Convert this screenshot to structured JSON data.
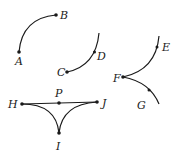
{
  "diagram": {
    "points": {
      "A": {
        "label": "A",
        "x": 19,
        "y": 52
      },
      "B": {
        "label": "B",
        "x": 56,
        "y": 15
      },
      "C": {
        "label": "C",
        "x": 67,
        "y": 72
      },
      "D": {
        "label": "D",
        "x": 94,
        "y": 51
      },
      "E": {
        "label": "E",
        "x": 157,
        "y": 46
      },
      "F": {
        "label": "F",
        "x": 123,
        "y": 77
      },
      "G": {
        "label": "G",
        "x": 149,
        "y": 89
      },
      "H": {
        "label": "H",
        "x": 22,
        "y": 104
      },
      "P": {
        "label": "P",
        "x": 59,
        "y": 103
      },
      "J": {
        "label": "J",
        "x": 97,
        "y": 102
      },
      "I": {
        "label": "I",
        "x": 59,
        "y": 133
      }
    },
    "figures": [
      {
        "name": "arc-AB",
        "endpoints": [
          "A",
          "B"
        ]
      },
      {
        "name": "arc-CD",
        "endpoints": [
          "C"
        ],
        "interior_points": [
          "D"
        ]
      },
      {
        "name": "curves-EFG",
        "endpoints": [
          "F"
        ],
        "interior_points": [
          "E",
          "G"
        ]
      },
      {
        "name": "triangle-HJI",
        "segment": [
          "H",
          "J"
        ],
        "midpoint": "P",
        "curves": [
          [
            "H",
            "I"
          ],
          [
            "J",
            "I"
          ]
        ]
      }
    ]
  }
}
